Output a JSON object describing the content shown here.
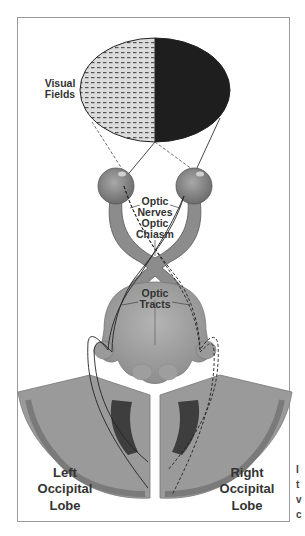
{
  "diagram": {
    "labels": {
      "visual_fields": [
        "Visual",
        "Fields"
      ],
      "optic_nerves": [
        "Optic",
        "Nerves"
      ],
      "optic_chiasm": [
        "Optic",
        "Chiasm"
      ],
      "optic_tracts": [
        "Optic",
        "Tracts"
      ],
      "left_lobe": [
        "Left",
        "Occipital",
        "Lobe"
      ],
      "right_lobe": [
        "Right",
        "Occipital",
        "Lobe"
      ]
    },
    "cut_off_text": [
      "I",
      "t",
      "v",
      "c"
    ],
    "colors": {
      "left_field_fill": "#d6d6d6",
      "right_field_fill": "#1e1e1e",
      "tissue": "#8f8f8f",
      "tissue_light": "#a8a8a8",
      "cortex_dark": "#6f6f6f",
      "ventricle": "#3e3e3e",
      "frame": "#9a9a9a"
    },
    "pathways": {
      "left_field": "dashed line → right occipital lobe",
      "right_field": "solid line → left occipital lobe"
    }
  }
}
